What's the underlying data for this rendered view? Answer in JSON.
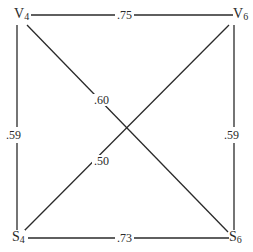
{
  "diagram": {
    "type": "weighted-graph",
    "nodes": [
      {
        "id": "V4",
        "letter": "V",
        "sub": "4",
        "position": "top-left"
      },
      {
        "id": "V6",
        "letter": "V",
        "sub": "6",
        "position": "top-right"
      },
      {
        "id": "S4",
        "letter": "S",
        "sub": "4",
        "position": "bottom-left"
      },
      {
        "id": "S6",
        "letter": "S",
        "sub": "6",
        "position": "bottom-right"
      }
    ],
    "edges": [
      {
        "from": "V4",
        "to": "V6",
        "weight": ".75"
      },
      {
        "from": "V4",
        "to": "S4",
        "weight": ".59"
      },
      {
        "from": "V6",
        "to": "S6",
        "weight": ".59"
      },
      {
        "from": "S4",
        "to": "S6",
        "weight": ".73"
      },
      {
        "from": "V4",
        "to": "S6",
        "weight": ".60"
      },
      {
        "from": "V6",
        "to": "S4",
        "weight": ".50"
      }
    ],
    "line_color": "#2a2a2a",
    "background": "#ffffff"
  }
}
